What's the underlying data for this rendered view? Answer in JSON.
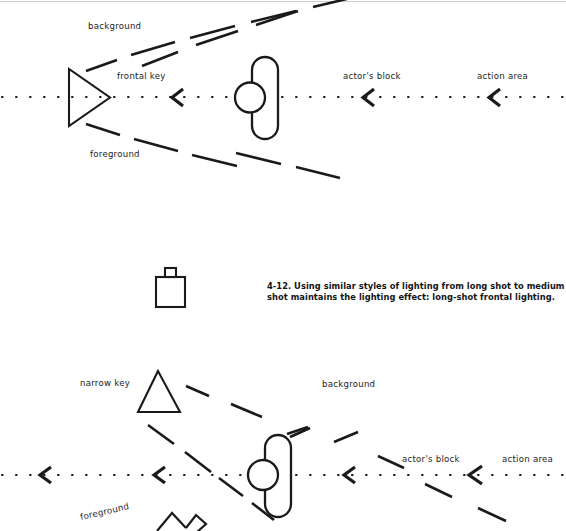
{
  "figure": {
    "caption_number": "4-12.",
    "caption_line1": "4-12. Using similar styles of lighting from long shot to medium",
    "caption_line2": "shot maintains the lighting effect: long-shot frontal lighting.",
    "ink_color": "#1a1a1a",
    "page_color": "#ffffff"
  },
  "top_diagram": {
    "name": "long-shot frontal lighting plan",
    "labels": {
      "background": "background",
      "frontal_key": "frontal key",
      "foreground": "foreground",
      "actors_block": "actor's block",
      "action_area": "action area"
    },
    "elements": {
      "key_light": "triangle-pointing-right",
      "actor": "capsule-with-head-circle",
      "axis": "dotted-camera-axis",
      "direction_markers": "chevron-left",
      "marker_count": 3,
      "beams": "dashed-light-cone"
    }
  },
  "camera_icon": {
    "name": "camera-viewfinder",
    "shape": "square-with-top-tab"
  },
  "bottom_diagram": {
    "name": "medium-shot frontal lighting plan",
    "labels": {
      "narrow_key": "narrow key",
      "background": "background",
      "foreground": "foreground",
      "actors_block": "actor's block",
      "action_area": "action area"
    },
    "elements": {
      "key_light": "triangle-pointing-up",
      "actor": "capsule-with-head-circle",
      "axis": "dotted-camera-axis",
      "direction_markers": "chevron-left",
      "marker_count": 4,
      "beams": "dashed-narrow-beam"
    }
  }
}
